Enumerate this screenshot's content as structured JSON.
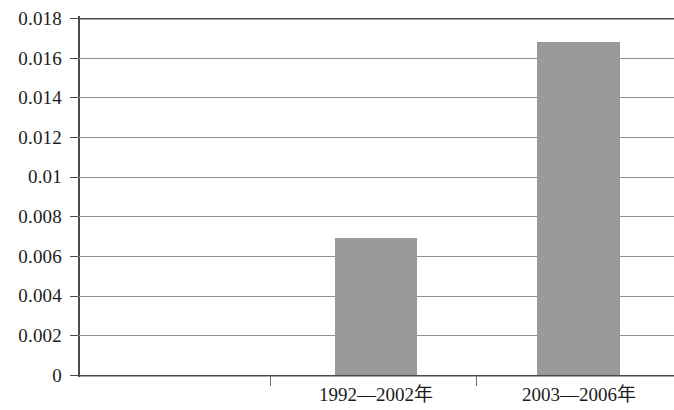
{
  "chart_data": {
    "type": "bar",
    "title": "",
    "subtitle": "",
    "xlabel": "",
    "ylabel": "",
    "categories": [
      "1992—2002年",
      "2003—2006年"
    ],
    "values": [
      0.0069,
      0.0168
    ],
    "ylim": [
      0,
      0.018
    ],
    "ytick_labels": [
      "0.018",
      "0.016",
      "0.014",
      "0.012",
      "0.01",
      "0.008",
      "0.006",
      "0.004",
      "0.002",
      "0"
    ],
    "ytick_values": [
      0.018,
      0.016,
      0.014,
      0.012,
      0.01,
      0.008,
      0.006,
      0.004,
      0.002,
      0
    ],
    "ytick_step": 0.002,
    "grid": true,
    "grid_axis": "y",
    "legend": false,
    "legend_position": "none",
    "series": [
      {
        "name": "",
        "values": [
          0.0069,
          0.0168
        ],
        "color": "#9a9a9a"
      }
    ],
    "colors": {
      "bar_fill": "#9a9a9a",
      "bar_border": "#979797",
      "gridline": "#8e8e8e",
      "axis": "#4a4a4a",
      "text": "#1c1c1c",
      "background": "#ffffff"
    }
  }
}
